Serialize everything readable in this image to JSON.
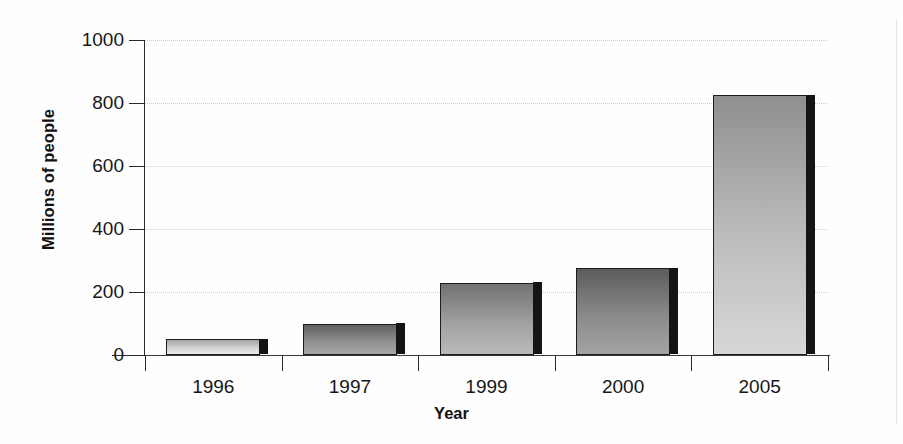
{
  "chart_data": {
    "type": "bar",
    "title": "",
    "subtitle": "",
    "xlabel": "Year",
    "ylabel": "Millions of people",
    "categories": [
      "1996",
      "1997",
      "1999",
      "2000",
      "2005"
    ],
    "values": [
      50,
      100,
      230,
      275,
      825
    ],
    "series": [
      {
        "name": "Millions of people",
        "values": [
          50,
          100,
          230,
          275,
          825
        ]
      }
    ],
    "ylim": [
      0,
      1000
    ],
    "yticks": [
      0,
      200,
      400,
      600,
      800,
      1000
    ],
    "ytick_labels": [
      "0",
      "200",
      "400",
      "600",
      "800",
      "1000"
    ],
    "grid": true,
    "grid_axis": "y",
    "grid_style": "dotted",
    "legend": false,
    "legend_position": "none",
    "annotations": [],
    "bar_colors": [
      "#d2d2d2",
      "#8e8e8e",
      "#a0a0a0",
      "#8a8a8a",
      "#bdbdbd"
    ],
    "bar_edge_color": "#1d1d1d",
    "bar_shadow_color": "#141414",
    "background_color": "#fefefe",
    "axis_color": "#2b2b2b",
    "gridline_color": "#c9c9c9",
    "text_color": "#161616"
  },
  "axes": {
    "y_title": "Millions of people",
    "x_title": "Year"
  }
}
